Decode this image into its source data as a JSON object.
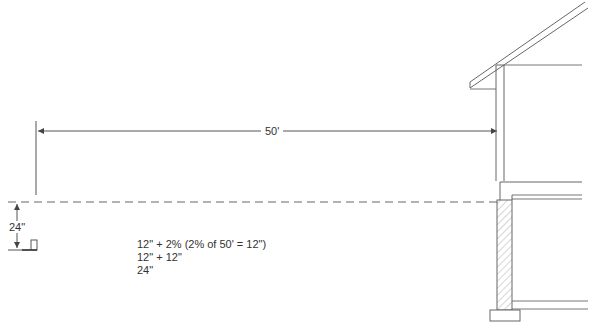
{
  "diagram": {
    "type": "slope-grading-section",
    "dimension_horizontal": {
      "label": "50'"
    },
    "dimension_vertical": {
      "label": "24\""
    },
    "calculation": {
      "lines": [
        "12\" + 2% (2% of 50' = 12\")",
        "12\" + 12\"",
        "24\""
      ]
    },
    "colors": {
      "line": "#555555",
      "hatch": "#888888",
      "background": "#ffffff"
    }
  }
}
